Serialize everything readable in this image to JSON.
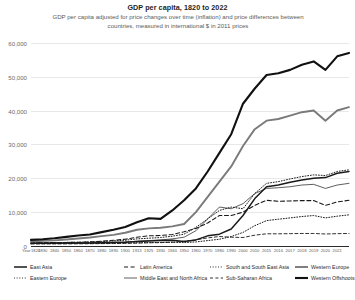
{
  "header": {
    "title": "GDP per capita, 1820 to 2022",
    "subtitle": "GDP per capita adjusted for price changes over time (inflation) and price differences between countries, measured in international $ in 2011 prices"
  },
  "axis": {
    "x_label": "Year",
    "y_ticks": [
      "60,000",
      "50,000",
      "40,000",
      "30,000",
      "20,000",
      "10,000",
      "0"
    ],
    "x_ticks": [
      "1820",
      "1830",
      "1840",
      "1850",
      "1860",
      "1870",
      "1880",
      "1890",
      "1900",
      "1913",
      "1925",
      "1930",
      "1940",
      "1950",
      "1960",
      "1970",
      "1980",
      "1990",
      "2000",
      "2010",
      "2015",
      "2016",
      "2017",
      "2018",
      "2019",
      "2020",
      "2021"
    ]
  },
  "legend": {
    "items": [
      {
        "label": "East Asia",
        "style": "solid-thick",
        "color": "#1a1a1a"
      },
      {
        "label": "Eastern Europe",
        "style": "dotted",
        "color": "#1a1a1a"
      },
      {
        "label": "Latin America",
        "style": "dashed",
        "color": "#1a1a1a"
      },
      {
        "label": "Middle East and North Africa",
        "style": "solid-thin",
        "color": "#1a1a1a"
      },
      {
        "label": "South and South East Asia",
        "style": "dotted",
        "color": "#1a1a1a"
      },
      {
        "label": "Sub-Saharan Africa",
        "style": "dashed-long",
        "color": "#1a1a1a"
      },
      {
        "label": "Western Europe",
        "style": "solid-grey",
        "color": "#7a7a7a"
      },
      {
        "label": "Western Offshoots",
        "style": "solid-black",
        "color": "#111111"
      }
    ]
  },
  "chart_data": {
    "type": "line",
    "title": "GDP per capita, 1820 to 2022",
    "subtitle": "GDP per capita adjusted for price changes over time (inflation) and price differences between countries, measured in international $ in 2011 prices",
    "xlabel": "Year",
    "ylabel": "",
    "xlim": [
      1820,
      2022
    ],
    "ylim": [
      0,
      62000
    ],
    "grid": true,
    "legend_position": "bottom",
    "x": [
      1820,
      1830,
      1840,
      1850,
      1860,
      1870,
      1880,
      1890,
      1900,
      1913,
      1925,
      1930,
      1940,
      1950,
      1960,
      1970,
      1980,
      1990,
      2000,
      2010,
      2015,
      2016,
      2017,
      2018,
      2019,
      2020,
      2021,
      2022
    ],
    "series": [
      {
        "name": "Western Offshoots",
        "style": "solid-black",
        "color": "#111111",
        "values": [
          1800,
          2000,
          2300,
          2700,
          3100,
          3400,
          4100,
          4800,
          5600,
          7000,
          8200,
          8000,
          10500,
          13500,
          17000,
          22000,
          27500,
          33000,
          42000,
          46500,
          50500,
          51000,
          52000,
          53500,
          54500,
          52000,
          56000,
          57000
        ]
      },
      {
        "name": "Western Europe",
        "style": "solid-grey",
        "color": "#7a7a7a",
        "values": [
          1400,
          1500,
          1650,
          1900,
          2200,
          2500,
          2900,
          3300,
          3900,
          4800,
          5200,
          5400,
          5800,
          6500,
          10000,
          14500,
          19000,
          23500,
          29500,
          34500,
          37000,
          37500,
          38500,
          39500,
          40000,
          37000,
          40000,
          41000
        ]
      },
      {
        "name": "East Asia",
        "style": "solid-thick",
        "color": "#1a1a1a",
        "values": [
          800,
          820,
          840,
          850,
          870,
          900,
          950,
          1000,
          1100,
          1300,
          1500,
          1600,
          1700,
          1300,
          1800,
          3000,
          3500,
          5000,
          9000,
          14000,
          17500,
          18000,
          18800,
          19500,
          20000,
          20200,
          21500,
          22000
        ]
      },
      {
        "name": "Eastern Europe",
        "style": "dotted",
        "color": "#1a1a1a",
        "values": [
          900,
          950,
          1000,
          1050,
          1100,
          1200,
          1350,
          1500,
          1700,
          2100,
          2300,
          2500,
          2900,
          3500,
          5500,
          8000,
          10500,
          11500,
          11000,
          15500,
          18500,
          19000,
          19800,
          20500,
          21000,
          20800,
          22000,
          22500
        ]
      },
      {
        "name": "Middle East and North Africa",
        "style": "solid-thin",
        "color": "#1a1a1a",
        "values": [
          800,
          820,
          850,
          880,
          900,
          950,
          1000,
          1100,
          1200,
          1400,
          1600,
          1800,
          2100,
          2600,
          4500,
          8000,
          11500,
          11000,
          12500,
          15500,
          17000,
          17200,
          17500,
          18000,
          18200,
          17000,
          18000,
          18500
        ]
      },
      {
        "name": "Latin America",
        "style": "dashed",
        "color": "#1a1a1a",
        "values": [
          900,
          950,
          1000,
          1050,
          1100,
          1200,
          1400,
          1700,
          2000,
          2600,
          3000,
          3100,
          3400,
          4200,
          5200,
          6800,
          9000,
          9000,
          10000,
          12000,
          13500,
          13200,
          13300,
          13400,
          13400,
          12000,
          13000,
          13500
        ]
      },
      {
        "name": "South and South East Asia",
        "style": "dotted",
        "color": "#1a1a1a",
        "values": [
          700,
          700,
          710,
          720,
          730,
          750,
          780,
          800,
          850,
          950,
          1000,
          1050,
          1100,
          1000,
          1200,
          1600,
          2000,
          2800,
          4000,
          6000,
          7500,
          7900,
          8300,
          8700,
          9000,
          8300,
          8800,
          9200
        ]
      },
      {
        "name": "Sub-Saharan Africa",
        "style": "dashed-long",
        "color": "#1a1a1a",
        "values": [
          600,
          610,
          620,
          630,
          650,
          670,
          700,
          730,
          780,
          850,
          950,
          1000,
          1100,
          1400,
          1800,
          2400,
          2800,
          2600,
          2500,
          3200,
          3600,
          3600,
          3650,
          3700,
          3700,
          3550,
          3650,
          3700
        ]
      }
    ]
  }
}
